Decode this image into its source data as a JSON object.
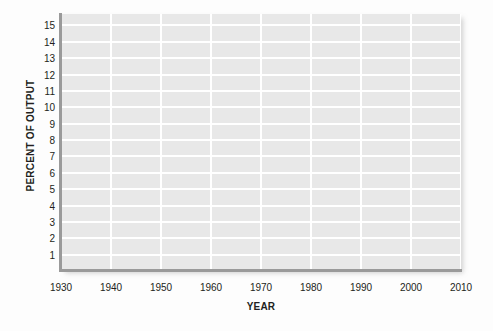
{
  "chart_data": {
    "type": "line",
    "title": "",
    "subtitle": "",
    "xlabel": "YEAR",
    "ylabel": "PERCENT OF OUTPUT",
    "x_ticks": [
      "1930",
      "1940",
      "1950",
      "1960",
      "1970",
      "1980",
      "1990",
      "2000",
      "2010"
    ],
    "y_ticks": [
      "15",
      "14",
      "13",
      "12",
      "11",
      "10",
      "9",
      "8",
      "7",
      "6",
      "5",
      "4",
      "3",
      "2",
      "1"
    ],
    "xlim": [
      1930,
      2010
    ],
    "ylim": [
      0,
      15.7
    ],
    "grid": true,
    "legend": "none",
    "series": [],
    "values": [],
    "categories": [],
    "annotations": [],
    "note": "Empty plot frame: gridlines and axes drawn, no data series plotted."
  },
  "style": {
    "plot_background": "#e8e8e8",
    "gridline_color": "#ffffff",
    "axis_color": "#9a9a9a",
    "text_color": "#231f20",
    "page_background": "#fdfdfd"
  }
}
